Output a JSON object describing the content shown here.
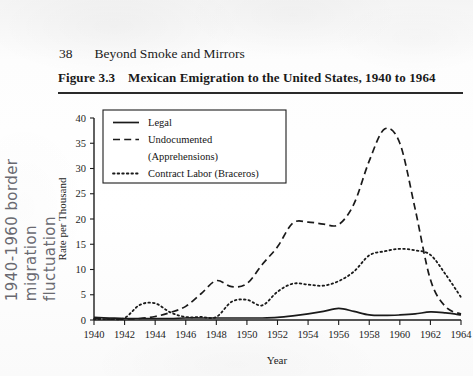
{
  "page": {
    "folio": "38",
    "running_head": "Beyond Smoke and Mirrors",
    "background_color": "#fbfbfb",
    "ink_color": "#1a1a1a"
  },
  "margin_note": {
    "line1": "1940-1960 border migration",
    "line2": "fluctuation",
    "ink_color": "#5d5d66"
  },
  "figure": {
    "number": "Figure 3.3",
    "title": "Mexican Emigration to the United States, 1940 to 1964"
  },
  "chart_data": {
    "type": "line",
    "title": "Mexican Emigration to the United States, 1940 to 1964",
    "xlabel": "Year",
    "ylabel": "Rate per Thousand",
    "xlim": [
      1940,
      1964
    ],
    "ylim": [
      0,
      40
    ],
    "xticks": [
      1940,
      1942,
      1944,
      1946,
      1948,
      1950,
      1952,
      1954,
      1956,
      1958,
      1960,
      1962,
      1964
    ],
    "yticks": [
      0,
      5,
      10,
      15,
      20,
      25,
      30,
      35,
      40
    ],
    "grid": false,
    "legend_position": "upper left",
    "x": [
      1940,
      1941,
      1942,
      1943,
      1944,
      1945,
      1946,
      1947,
      1948,
      1949,
      1950,
      1951,
      1952,
      1953,
      1954,
      1955,
      1956,
      1957,
      1958,
      1959,
      1960,
      1961,
      1962,
      1963,
      1964
    ],
    "series": [
      {
        "name": "Legal",
        "style": "solid",
        "values": [
          0.5,
          0.4,
          0.3,
          0.3,
          0.3,
          0.3,
          0.4,
          0.4,
          0.4,
          0.4,
          0.4,
          0.4,
          0.5,
          0.8,
          1.2,
          1.7,
          2.3,
          1.7,
          1.0,
          0.9,
          1.0,
          1.2,
          1.6,
          1.4,
          1.0
        ]
      },
      {
        "name": "Undocumented (Apprehensions)",
        "style": "dashed",
        "values": [
          0.3,
          0.2,
          0.2,
          0.3,
          0.7,
          1.5,
          2.7,
          5.2,
          7.8,
          6.6,
          7.2,
          11.0,
          14.5,
          19.2,
          19.4,
          19.0,
          18.9,
          23.0,
          31.5,
          37.8,
          35.0,
          22.0,
          8.0,
          2.6,
          1.2
        ],
        "note": "Peak of 37.8 occurs in 1953-1954; values mapped across the plotted curve"
      },
      {
        "name": "Contract Labor (Braceros)",
        "style": "dotted",
        "values": [
          0.2,
          0.2,
          0.4,
          3.0,
          3.3,
          1.5,
          0.6,
          0.6,
          0.6,
          3.6,
          4.0,
          2.9,
          5.6,
          7.2,
          7.0,
          6.8,
          7.7,
          9.6,
          12.8,
          13.6,
          14.1,
          13.8,
          12.9,
          9.0,
          4.5
        ],
        "note": "Peak near 14.1 around 1956-1957, declining to 4.5 by 1964"
      }
    ]
  },
  "legend": {
    "items": [
      {
        "label": "Legal",
        "style": "solid"
      },
      {
        "label": "Undocumented",
        "style": "dashed"
      },
      {
        "label": "(Apprehensions)",
        "style": "none"
      },
      {
        "label": "Contract Labor (Braceros)",
        "style": "dotted"
      }
    ]
  }
}
